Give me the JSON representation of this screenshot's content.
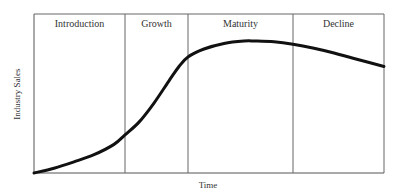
{
  "chart_data": {
    "type": "line",
    "title": "",
    "xlabel": "Time",
    "ylabel": "Industry Sales",
    "xlim": [
      0,
      350
    ],
    "ylim": [
      0,
      100
    ],
    "grid": false,
    "legend": "none",
    "stages": [
      {
        "name": "Introduction",
        "start": 0,
        "end": 91
      },
      {
        "name": "Growth",
        "start": 91,
        "end": 154
      },
      {
        "name": "Maturity",
        "start": 154,
        "end": 259
      },
      {
        "name": "Decline",
        "start": 259,
        "end": 350
      }
    ],
    "series": [
      {
        "name": "Industry Sales",
        "x": [
          0,
          20,
          40,
          60,
          80,
          91,
          105,
          120,
          135,
          145,
          154,
          170,
          190,
          210,
          221,
          240,
          259,
          280,
          300,
          320,
          350
        ],
        "y": [
          0,
          3,
          7,
          11.5,
          18,
          24,
          32,
          44,
          58,
          67,
          73,
          78,
          81.5,
          83,
          83,
          82.5,
          81,
          78.5,
          75.5,
          72,
          67
        ]
      }
    ]
  }
}
